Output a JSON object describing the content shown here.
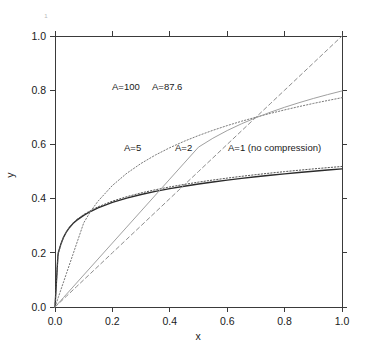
{
  "chart_data": {
    "type": "line",
    "title": "",
    "xlabel": "x",
    "ylabel": "y",
    "xlim": [
      0,
      1
    ],
    "ylim": [
      0,
      1
    ],
    "grid": false,
    "legend": "inline-annotations",
    "xticks": [
      "0.0",
      "0.2",
      "0.4",
      "0.6",
      "0.8",
      "1.0"
    ],
    "xtick_values": [
      0,
      0.2,
      0.4,
      0.6,
      0.8,
      1
    ],
    "yticks": [
      "0.0",
      "0.2",
      "0.4",
      "0.6",
      "0.8",
      "1.0"
    ],
    "ytick_values": [
      0,
      0.2,
      0.4,
      0.6,
      0.8,
      1
    ],
    "x": [
      0,
      0.005,
      0.01,
      0.0114,
      0.02,
      0.03,
      0.04,
      0.05,
      0.0625,
      0.075,
      0.1,
      0.125,
      0.15,
      0.2,
      0.25,
      0.3,
      0.35,
      0.4,
      0.45,
      0.5,
      0.55,
      0.6,
      0.65,
      0.7,
      0.75,
      0.8,
      0.85,
      0.9,
      0.95,
      1
    ],
    "series": [
      {
        "name": "A=100",
        "label": "A=100",
        "A": 100,
        "style": "solid",
        "color": "#2b2b2b",
        "values": [
          0,
          0.0937,
          0.1874,
          0.2,
          0.2303,
          0.2579,
          0.2775,
          0.2927,
          0.3078,
          0.3196,
          0.3382,
          0.3532,
          0.3657,
          0.3859,
          0.4019,
          0.4152,
          0.4266,
          0.4367,
          0.4457,
          0.4539,
          0.4613,
          0.4682,
          0.4746,
          0.4805,
          0.4861,
          0.4913,
          0.4963,
          0.501,
          0.5055,
          0.5098
        ]
      },
      {
        "name": "A=87.6",
        "label": "A=87.6",
        "A": 87.6,
        "style": "dotted",
        "color": "#555555",
        "values": [
          0,
          0.0925,
          0.185,
          0.197,
          0.2298,
          0.2583,
          0.2785,
          0.2942,
          0.3098,
          0.322,
          0.3412,
          0.3567,
          0.3697,
          0.3906,
          0.4071,
          0.4209,
          0.4327,
          0.443,
          0.4523,
          0.4608,
          0.4685,
          0.4756,
          0.4822,
          0.4884,
          0.4941,
          0.4996,
          0.5047,
          0.5096,
          0.5142,
          0.5186
        ]
      },
      {
        "name": "A=5",
        "label": "A=5",
        "A": 5,
        "style": "dotted",
        "color": "#7a7a7a",
        "values": [
          0,
          0.0155,
          0.031,
          0.0354,
          0.0621,
          0.0931,
          0.1241,
          0.1552,
          0.1939,
          0.2328,
          0.3104,
          0.3545,
          0.3906,
          0.4484,
          0.4933,
          0.5299,
          0.5609,
          0.5878,
          0.6115,
          0.6327,
          0.6519,
          0.6694,
          0.6855,
          0.7004,
          0.7143,
          0.7273,
          0.7395,
          0.7511,
          0.762,
          0.7724
        ]
      },
      {
        "name": "A=2",
        "label": "A=2",
        "A": 2,
        "style": "solid-light",
        "color": "#a0a0a0",
        "values": [
          0,
          0.0059,
          0.0118,
          0.0134,
          0.0236,
          0.0354,
          0.0472,
          0.059,
          0.0737,
          0.0885,
          0.118,
          0.1475,
          0.177,
          0.236,
          0.295,
          0.354,
          0.413,
          0.472,
          0.531,
          0.59,
          0.6227,
          0.6511,
          0.6761,
          0.6985,
          0.7186,
          0.737,
          0.7538,
          0.7694,
          0.7838,
          0.7973
        ]
      },
      {
        "name": "A=1 (no compression)",
        "label": "A=1 (no compression)",
        "A": 1,
        "style": "dashed",
        "color": "#8c8c8c",
        "values": [
          0,
          0.005,
          0.01,
          0.0114,
          0.02,
          0.03,
          0.04,
          0.05,
          0.0625,
          0.075,
          0.1,
          0.125,
          0.15,
          0.2,
          0.25,
          0.3,
          0.35,
          0.4,
          0.45,
          0.5,
          0.55,
          0.6,
          0.65,
          0.7,
          0.75,
          0.8,
          0.85,
          0.9,
          0.95,
          1
        ]
      }
    ],
    "annotations": [
      {
        "text": "A=100",
        "x_px": 112,
        "y_px": 90
      },
      {
        "text": "A=87.6",
        "x_px": 152,
        "y_px": 90
      },
      {
        "text": "A=5",
        "x_px": 124,
        "y_px": 151
      },
      {
        "text": "A=2",
        "x_px": 175,
        "y_px": 151
      },
      {
        "text": "A=1 (no compression)",
        "x_px": 228,
        "y_px": 151
      }
    ],
    "stray_mark": "1"
  }
}
